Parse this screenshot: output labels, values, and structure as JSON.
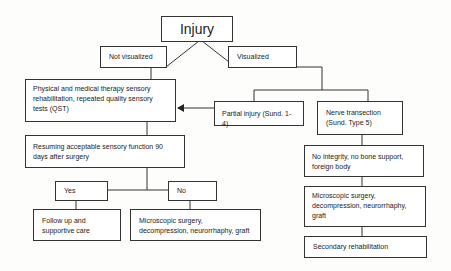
{
  "diagram": {
    "type": "flowchart",
    "root": {
      "label": "Injury"
    },
    "branches": {
      "not_visualized": {
        "label": "Not visualized"
      },
      "visualized": {
        "label": "Visualized"
      }
    },
    "nodes": {
      "physical_therapy": {
        "label": "Physical and medical therapy sensory rehabilitation, repeated quality sensory tests (QST)"
      },
      "resuming": {
        "label": "Resuming acceptable sensory function 90 days after surgery"
      },
      "yes": {
        "label": "Yes"
      },
      "no": {
        "label": "No"
      },
      "follow_up": {
        "label": "Follow up and supportive care"
      },
      "micro_surgery_left": {
        "label": "Microscopic surgery, decompression, neurorrhaphy, graft"
      },
      "partial_injury": {
        "label": "Partial injury (Sund. 1-4)"
      },
      "nerve_transection": {
        "label": "Nerve transection (Sund. Type 5)"
      },
      "no_integrity": {
        "label": "No integrity, no bone support, foreign body"
      },
      "micro_surgery_right": {
        "label": "Microscopic surgery, decompression, neurorrhaphy, graft"
      },
      "secondary_rehab": {
        "label": "Secondary rehabilitation"
      }
    },
    "edges": [
      {
        "from": "Injury",
        "to": "Not visualized"
      },
      {
        "from": "Injury",
        "to": "Visualized"
      },
      {
        "from": "Not visualized",
        "to": "Physical and medical therapy sensory rehabilitation, repeated quality sensory tests (QST)"
      },
      {
        "from": "Physical and medical therapy sensory rehabilitation, repeated quality sensory tests (QST)",
        "to": "Resuming acceptable sensory function 90 days after surgery"
      },
      {
        "from": "Resuming acceptable sensory function 90 days after surgery",
        "to": "Yes"
      },
      {
        "from": "Resuming acceptable sensory function 90 days after surgery",
        "to": "No"
      },
      {
        "from": "Yes",
        "to": "Follow up and supportive care"
      },
      {
        "from": "No",
        "to": "Microscopic surgery, decompression, neurorrhaphy, graft"
      },
      {
        "from": "Visualized",
        "to": "Partial injury (Sund. 1-4)"
      },
      {
        "from": "Visualized",
        "to": "Nerve transection (Sund. Type 5)"
      },
      {
        "from": "Partial injury (Sund. 1-4)",
        "to": "Physical and medical therapy sensory rehabilitation, repeated quality sensory tests (QST)",
        "arrow": true
      },
      {
        "from": "Nerve transection (Sund. Type 5)",
        "to": "No integrity, no bone support, foreign body"
      },
      {
        "from": "No integrity, no bone support, foreign body",
        "to": "Microscopic surgery, decompression, neurorrhaphy, graft"
      },
      {
        "from": "Microscopic surgery, decompression, neurorrhaphy, graft",
        "to": "Secondary rehabilitation"
      }
    ],
    "colors": {
      "line": "#333333",
      "box_fill": "#ffffff",
      "background": "#fdfdfb",
      "text": "#222222"
    }
  }
}
